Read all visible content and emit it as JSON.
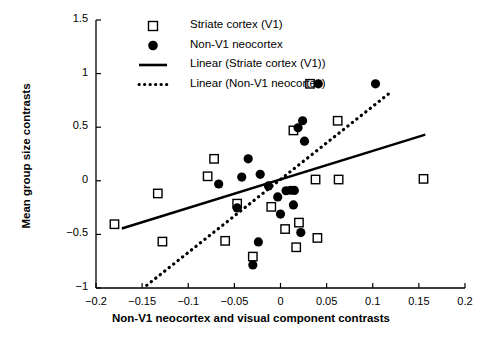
{
  "chart_data": {
    "type": "scatter",
    "title": "",
    "xlabel": "Non-V1 neocortex and visual component contrasts",
    "ylabel": "Mean group size contrasts",
    "xlim": [
      -0.2,
      0.2
    ],
    "ylim": [
      -1,
      1.5
    ],
    "grid": false,
    "legend_position": "top-right-inside",
    "xticks": [
      "-0.2",
      "-0.15",
      "-0.1",
      "-0.05",
      "0",
      "0.05",
      "0.1",
      "0.15",
      "0.2"
    ],
    "xtick_values": [
      -0.2,
      -0.15,
      -0.1,
      -0.05,
      0,
      0.05,
      0.1,
      0.15,
      0.2
    ],
    "yticks": [
      "1.5",
      "1",
      "0.5",
      "0",
      "-0.5",
      "-1"
    ],
    "ytick_values": [
      1.5,
      1,
      0.5,
      0,
      -0.5,
      -1
    ],
    "series": [
      {
        "name": "Striate cortex (V1)",
        "marker": "open-square",
        "color": "#000000",
        "points": [
          [
            -0.18,
            -0.405
          ],
          [
            -0.133,
            -0.118
          ],
          [
            -0.128,
            -0.567
          ],
          [
            -0.072,
            0.205
          ],
          [
            -0.079,
            0.042
          ],
          [
            -0.06,
            -0.56
          ],
          [
            -0.047,
            -0.213
          ],
          [
            -0.03,
            -0.707
          ],
          [
            -0.01,
            -0.243
          ],
          [
            0.005,
            -0.45
          ],
          [
            0.014,
            0.47
          ],
          [
            0.017,
            -0.62
          ],
          [
            0.02,
            -0.39
          ],
          [
            0.032,
            0.905
          ],
          [
            0.038,
            0.012
          ],
          [
            0.04,
            -0.533
          ],
          [
            0.062,
            0.56
          ],
          [
            0.063,
            0.012
          ],
          [
            0.155,
            0.018
          ]
        ]
      },
      {
        "name": "Non-V1 neocortex",
        "marker": "filled-circle",
        "color": "#000000",
        "points": [
          [
            -0.067,
            -0.03
          ],
          [
            -0.042,
            0.035
          ],
          [
            -0.047,
            -0.253
          ],
          [
            -0.035,
            0.205
          ],
          [
            -0.03,
            -0.785
          ],
          [
            -0.024,
            -0.57
          ],
          [
            -0.022,
            0.06
          ],
          [
            -0.013,
            -0.048
          ],
          [
            -0.003,
            -0.15
          ],
          [
            0.0,
            -0.31
          ],
          [
            0.006,
            -0.093
          ],
          [
            0.011,
            -0.088
          ],
          [
            0.015,
            -0.09
          ],
          [
            0.014,
            -0.225
          ],
          [
            0.022,
            -0.483
          ],
          [
            0.019,
            0.495
          ],
          [
            0.024,
            0.56
          ],
          [
            0.026,
            0.37
          ],
          [
            0.041,
            0.905
          ],
          [
            0.103,
            0.905
          ]
        ]
      }
    ],
    "trendlines": [
      {
        "name": "Linear (Striate cortex (V1))",
        "style": "solid",
        "color": "#000000",
        "x0": -0.172,
        "y0": -0.445,
        "x1": 0.157,
        "y1": 0.43
      },
      {
        "name": "Linear (Non-V1 neocortex)",
        "style": "dotted",
        "color": "#000000",
        "x0": -0.145,
        "y0": -0.975,
        "x1": 0.117,
        "y1": 0.81
      }
    ],
    "legend": [
      {
        "label": "Striate cortex (V1)",
        "marker": "open-square"
      },
      {
        "label": "Non-V1 neocortex",
        "marker": "filled-circle"
      },
      {
        "label": "Linear (Striate cortex (V1))",
        "marker": "solid-line"
      },
      {
        "label": "Linear (Non-V1 neocortex)",
        "marker": "dotted-line"
      }
    ]
  }
}
